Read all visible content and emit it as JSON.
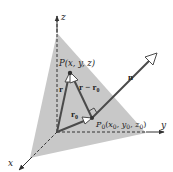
{
  "diagram": {
    "title": "",
    "type": "3d-vector-plane",
    "colors": {
      "plane": "#c8c8c8",
      "vector": "#4a4a4a",
      "axis": "#333333",
      "text": "#222222"
    },
    "axes": {
      "x": {
        "label": "x"
      },
      "y": {
        "label": "y"
      },
      "z": {
        "label": "z"
      }
    },
    "points": {
      "P": {
        "label": "P(x, y, z)"
      },
      "P0": {
        "label_main": "P",
        "label_sub": "0",
        "label_rest": "(x",
        "coords": [
          "x0",
          "y0",
          "z0"
        ]
      }
    },
    "vectors": {
      "n": {
        "label": "n"
      },
      "r": {
        "label": "r"
      },
      "r0": {
        "label_main": "r",
        "label_sub": "0"
      },
      "r_minus_r0": {
        "label_main": "r − r",
        "label_sub": "0"
      }
    },
    "p0_label": {
      "P": "P",
      "sub0": "0",
      "x": "x",
      "y": "y",
      "z": "z",
      "open": "(",
      "close": ")",
      "comma": ", "
    }
  }
}
